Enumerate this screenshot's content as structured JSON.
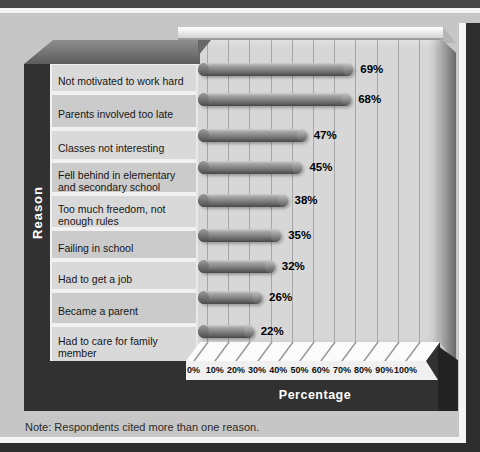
{
  "figure": {
    "note": "Note: Respondents cited more than one reason."
  },
  "chart_data": {
    "type": "bar",
    "orientation": "horizontal",
    "title": "",
    "xlabel": "Percentage",
    "ylabel": "Reason",
    "categories": [
      "Not motivated to work hard",
      "Parents involved too late",
      "Classes not interesting",
      "Fell behind in elementary and secondary school",
      "Too much freedom, not enough rules",
      "Failing in school",
      "Had to get a job",
      "Became a parent",
      "Had to care for family member"
    ],
    "values": [
      69,
      68,
      47,
      45,
      38,
      35,
      32,
      26,
      22
    ],
    "value_labels": [
      "69%",
      "68%",
      "47%",
      "45%",
      "38%",
      "35%",
      "32%",
      "26%",
      "22%"
    ],
    "x_ticks": [
      "0%",
      "10%",
      "20%",
      "30%",
      "40%",
      "50%",
      "60%",
      "70%",
      "80%",
      "90%",
      "100%"
    ],
    "xlim": [
      0,
      100
    ],
    "grid": "vertical",
    "legend": "none",
    "note": "Note: Respondents cited more than one reason."
  },
  "colors": {
    "page_bg": "#c6c6c6",
    "slab_dark": "#313131",
    "wall_bg": "#d7d7d7",
    "gridline": "#a6a6a6",
    "bar_gray": "#7d7d7d",
    "row_light": "#d9d9d9",
    "row_dark": "#cbcbcb",
    "floor_white": "#fbfbfb",
    "label_text": "#161616",
    "axis_text_white": "#ffffff"
  }
}
